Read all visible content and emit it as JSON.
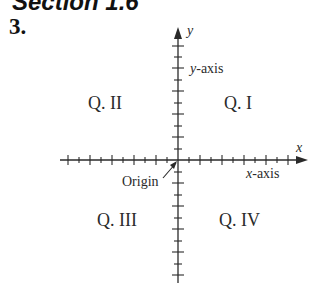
{
  "header": {
    "section_title": "Section 1.6",
    "problem_number": "3."
  },
  "diagram": {
    "type": "coordinate-plane",
    "axis_labels": {
      "x": "x",
      "y": "y"
    },
    "axis_names": {
      "x": "x-axis",
      "y": "y-axis"
    },
    "origin_label": "Origin",
    "quadrants": {
      "q1": "Q. I",
      "q2": "Q. II",
      "q3": "Q. III",
      "q4": "Q. IV"
    },
    "colors": {
      "ink": "#2a2a2a",
      "background": "#ffffff"
    }
  }
}
